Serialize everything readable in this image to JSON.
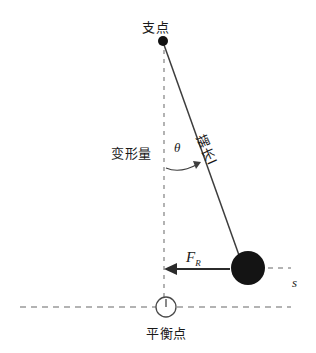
{
  "diagram": {
    "type": "physics-free-body-diagram",
    "canvas": {
      "width": 316,
      "height": 353,
      "background": "#ffffff"
    },
    "colors": {
      "stroke": "#3a3a3a",
      "dashed": "#9a9a9a",
      "ball_fill": "#1a1a1a",
      "text": "#1a1a1a"
    },
    "labels": {
      "pivot": "支点",
      "deformation": "变形量",
      "equilibrium": "平衡点",
      "pendulum_length": "摆长l",
      "angle": "θ",
      "force": "F",
      "force_subscript": "R",
      "axis_s": "s"
    },
    "geometry": {
      "pivot_point": {
        "x": 163,
        "y": 41,
        "radius": 5
      },
      "bob": {
        "x": 248,
        "y": 268,
        "radius": 17
      },
      "vertical_dashed_line": {
        "x": 164,
        "y1": 50,
        "y2": 307
      },
      "string": {
        "x1": 163,
        "y1": 41,
        "x2": 240,
        "y2": 258
      },
      "angle_arc": {
        "center_x": 164,
        "center_y": 41,
        "radius": 128,
        "label_angle_deg": 19
      },
      "force_arrow": {
        "x1": 228,
        "y1": 269,
        "x2": 166,
        "y2": 269,
        "direction": "left"
      },
      "horizontal_dashed_baseline": {
        "y": 307,
        "x1": 20,
        "x2": 291
      },
      "bob_dashed_extension": {
        "y": 268,
        "x1": 266,
        "x2": 291
      },
      "equilibrium_marker": {
        "x": 166,
        "y": 307,
        "radius": 10
      }
    }
  }
}
